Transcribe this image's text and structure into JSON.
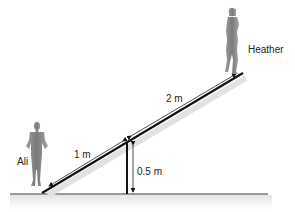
{
  "diagram": {
    "type": "seesaw-physics",
    "people": [
      {
        "name": "Ali",
        "position": "left end (lower)"
      },
      {
        "name": "Heather",
        "position": "right end (raised)"
      }
    ],
    "labels": {
      "ali": "Ali",
      "heather": "Heather",
      "left_length": "1 m",
      "right_length": "2 m",
      "pivot_height": "0.5 m"
    },
    "colors": {
      "plank": "#111111",
      "figure": "#8a8a8a",
      "ground": "#333333",
      "shadow": "#e6e6e6"
    }
  }
}
